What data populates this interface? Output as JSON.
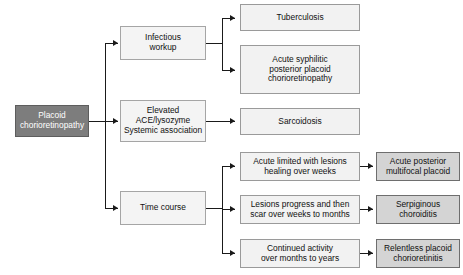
{
  "diagram": {
    "colors": {
      "root_fill": "#7d7d7d",
      "root_text": "#ffffff",
      "node_fill": "#f2f2f2",
      "outcome_fill": "#d4d4d4",
      "border": "#9a9a9a",
      "connector": "#1a1a1a"
    },
    "root": {
      "label": "Placoid\nchorioretinopathy"
    },
    "branches": [
      {
        "label": "Infectious\nworkup",
        "children": [
          {
            "label": "Tuberculosis"
          },
          {
            "label": "Acute syphilitic\nposterior placoid\nchorioretinopathy"
          }
        ]
      },
      {
        "label": "Elevated\nACE/lysozyme\nSystemic association",
        "children": [
          {
            "label": "Sarcoidosis"
          }
        ]
      },
      {
        "label": "Time course",
        "children": [
          {
            "label": "Acute limited with lesions\nhealing over weeks",
            "outcome": "Acute posterior\nmultifocal placoid"
          },
          {
            "label": "Lesions progress and then\nscar over weeks to months",
            "outcome": "Serpiginous\nchoroiditis"
          },
          {
            "label": "Continued activity\nover months to years",
            "outcome": "Relentless placoid\nchorioretinitis"
          }
        ]
      }
    ]
  }
}
